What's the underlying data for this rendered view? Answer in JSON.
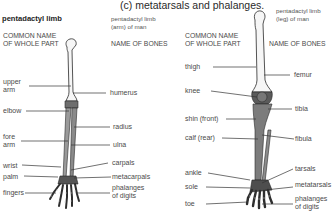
{
  "title": "(c) metatarsals and phalanges.",
  "arm": {
    "heading": "pentadactyl limb",
    "subheading": "pentadactyl limb (arm) of man",
    "subheading_line1": "pentadactyl limb",
    "subheading_line2": "(arm) of man",
    "common_name_header_line1": "COMMON NAME",
    "common_name_header_line2": "OF WHOLE PART",
    "bones_header": "NAME OF BONES",
    "common_names": [
      "upper",
      "arm",
      "elbow",
      "fore",
      "arm",
      "wrist",
      "palm",
      "fingers"
    ],
    "common_labels": {
      "upper_arm_1": "upper",
      "upper_arm_2": "arm",
      "elbow": "elbow",
      "fore_arm_1": "fore",
      "fore_arm_2": "arm",
      "wrist": "wrist",
      "palm": "palm",
      "fingers": "fingers"
    },
    "bone_labels": {
      "humerus": "humerus",
      "radius": "radius",
      "ulna": "ulna",
      "carpals": "carpals",
      "metacarpals": "metacarpals",
      "phalanges_1": "phalanges",
      "phalanges_2": "of digits"
    }
  },
  "leg": {
    "subheading_line1": "pentadactyl limb",
    "subheading_line2": "(leg) of man",
    "common_name_header_line1": "COMMON NAME",
    "common_name_header_line2": "OF WHOLE PART",
    "bones_header": "NAME OF BONES",
    "common_labels": {
      "thigh": "thigh",
      "knee": "knee",
      "shin": "shin (front)",
      "calf": "calf (rear)",
      "ankle": "ankle",
      "sole": "sole",
      "toe": "toe"
    },
    "bone_labels": {
      "femur": "femur",
      "tibia": "tibia",
      "fibula": "fibula",
      "tarsals": "tarsals",
      "metatarsals": "metatarsals",
      "phalanges_1": "phalanges",
      "phalanges_2": "of digits"
    }
  },
  "colors": {
    "background": "#ffffff",
    "bone_light": "#f4f4f4",
    "bone_shaded": "#7a7a7a",
    "outline": "#2a2a2a",
    "leader_line": "#333333",
    "text": "#4a4a4a"
  }
}
